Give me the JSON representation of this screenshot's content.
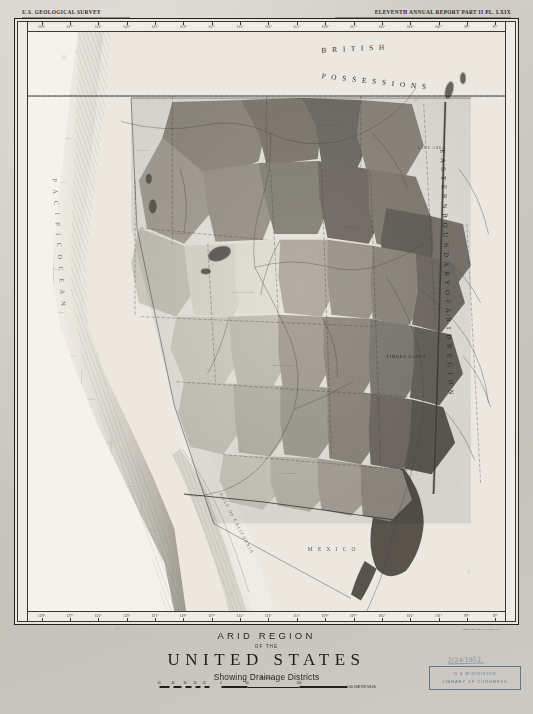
{
  "header": {
    "left": "U.S. GEOLOGICAL SURVEY",
    "right": "ELEVENTH ANNUAL REPORT PART II PL. LXIX"
  },
  "title_block": {
    "line1": "ARID REGION",
    "line2": "OF THE",
    "line3": "UNITED STATES",
    "line4": "Showing Drainage Districts"
  },
  "scale": {
    "label": "Scale",
    "unit": "100 STATUTE MILES",
    "ticks": [
      "50",
      "40",
      "30",
      "20",
      "10",
      "0",
      "50",
      "100"
    ]
  },
  "credit": "Julius Bien & Co. Lith. N.Y.",
  "stamp": {
    "date": "2/24/1952",
    "line1": "G & M DIVISION",
    "line2": "LIBRARY OF CONGRESS"
  },
  "graticule": {
    "lon_top": [
      "129°",
      "127°",
      "125°",
      "123°",
      "121°",
      "119°",
      "117°",
      "115°",
      "113°",
      "111°",
      "109°",
      "107°",
      "105°",
      "103°",
      "101°",
      "99°",
      "97°"
    ],
    "lon_bottom": [
      "129°",
      "127°",
      "125°",
      "123°",
      "121°",
      "119°",
      "117°",
      "115°",
      "113°",
      "111°",
      "109°",
      "107°",
      "105°",
      "103°",
      "101°",
      "99°",
      "97°"
    ],
    "lat_left": [
      "49°",
      "47°",
      "45°",
      "43°",
      "41°",
      "39°",
      "37°",
      "35°",
      "33°",
      "31°",
      "29°",
      "27°",
      "25°",
      "23°"
    ],
    "lat_right": [
      "49°",
      "47°",
      "45°",
      "43°",
      "41°",
      "39°",
      "37°",
      "35°",
      "33°",
      "31°",
      "29°",
      "27°",
      "25°",
      "23°"
    ]
  },
  "map_labels": {
    "british_possessions": "BRITISH POSSESSIONS",
    "eastern_boundary": "EASTERN BOUNDARY OF ARID REGION",
    "pacific_ocean": "PACIFIC OCEAN",
    "gulf_of_california": "GULF OF CALIFORNIA",
    "mexico": "MEXICO",
    "timber_lands": "TIMBER LANDS",
    "large_lakes": "LAKE AREA"
  },
  "colors": {
    "paper": "#cdcac3",
    "ink": "#23201c",
    "map_base": "#efece5",
    "water": "#f3f1ea",
    "stamp_blue": "#5f7490",
    "district_light": "#cdc9bf",
    "district_mid": "#a9a49a",
    "district_dark": "#7c776d",
    "district_darkest": "#59554d"
  }
}
